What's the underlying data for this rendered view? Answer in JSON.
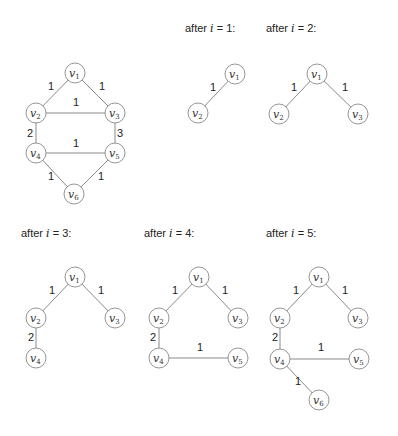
{
  "diagram": {
    "node_radius": 10,
    "panels": [
      {
        "id": "original",
        "caption": null,
        "nodes": [
          {
            "id": "v1",
            "label": "v",
            "sub": "1",
            "x": 75,
            "y": 73
          },
          {
            "id": "v2",
            "label": "v",
            "sub": "2",
            "x": 36,
            "y": 113
          },
          {
            "id": "v3",
            "label": "v",
            "sub": "3",
            "x": 115,
            "y": 113
          },
          {
            "id": "v4",
            "label": "v",
            "sub": "4",
            "x": 36,
            "y": 153
          },
          {
            "id": "v5",
            "label": "v",
            "sub": "5",
            "x": 115,
            "y": 153
          },
          {
            "id": "v6",
            "label": "v",
            "sub": "6",
            "x": 74,
            "y": 194
          }
        ],
        "edges": [
          {
            "from": "v1",
            "to": "v2",
            "weight": "1",
            "lx": 48,
            "ly": 90
          },
          {
            "from": "v1",
            "to": "v3",
            "weight": "1",
            "lx": 99,
            "ly": 90
          },
          {
            "from": "v2",
            "to": "v3",
            "weight": "1",
            "lx": 73,
            "ly": 106
          },
          {
            "from": "v2",
            "to": "v4",
            "weight": "2",
            "lx": 27,
            "ly": 137
          },
          {
            "from": "v3",
            "to": "v5",
            "weight": "3",
            "lx": 117,
            "ly": 137
          },
          {
            "from": "v4",
            "to": "v5",
            "weight": "1",
            "lx": 73,
            "ly": 147
          },
          {
            "from": "v4",
            "to": "v6",
            "weight": "1",
            "lx": 48,
            "ly": 180
          },
          {
            "from": "v5",
            "to": "v6",
            "weight": "1",
            "lx": 98,
            "ly": 180
          }
        ]
      },
      {
        "id": "after-1",
        "caption": {
          "prefix": "after ",
          "var": "i",
          "suffix": " = 1:",
          "x": 185,
          "y": 32
        },
        "nodes": [
          {
            "id": "v1",
            "label": "v",
            "sub": "1",
            "x": 235,
            "y": 74
          },
          {
            "id": "v2",
            "label": "v",
            "sub": "2",
            "x": 198,
            "y": 113
          }
        ],
        "edges": [
          {
            "from": "v1",
            "to": "v2",
            "weight": "1",
            "lx": 210,
            "ly": 91
          }
        ]
      },
      {
        "id": "after-2",
        "caption": {
          "prefix": "after ",
          "var": "i",
          "suffix": " = 2:",
          "x": 266,
          "y": 32
        },
        "nodes": [
          {
            "id": "v1",
            "label": "v",
            "sub": "1",
            "x": 317,
            "y": 74
          },
          {
            "id": "v2",
            "label": "v",
            "sub": "2",
            "x": 279,
            "y": 114
          },
          {
            "id": "v3",
            "label": "v",
            "sub": "3",
            "x": 358,
            "y": 114
          }
        ],
        "edges": [
          {
            "from": "v1",
            "to": "v2",
            "weight": "1",
            "lx": 291,
            "ly": 91
          },
          {
            "from": "v1",
            "to": "v3",
            "weight": "1",
            "lx": 342,
            "ly": 91
          }
        ]
      },
      {
        "id": "after-3",
        "caption": {
          "prefix": "after ",
          "var": "i",
          "suffix": " = 3:",
          "x": 21,
          "y": 237
        },
        "nodes": [
          {
            "id": "v1",
            "label": "v",
            "sub": "1",
            "x": 75,
            "y": 277
          },
          {
            "id": "v2",
            "label": "v",
            "sub": "2",
            "x": 36,
            "y": 318
          },
          {
            "id": "v3",
            "label": "v",
            "sub": "3",
            "x": 115,
            "y": 318
          },
          {
            "id": "v4",
            "label": "v",
            "sub": "4",
            "x": 36,
            "y": 358
          }
        ],
        "edges": [
          {
            "from": "v1",
            "to": "v2",
            "weight": "1",
            "lx": 49,
            "ly": 294
          },
          {
            "from": "v1",
            "to": "v3",
            "weight": "1",
            "lx": 98,
            "ly": 294
          },
          {
            "from": "v2",
            "to": "v4",
            "weight": "2",
            "lx": 28,
            "ly": 341
          }
        ]
      },
      {
        "id": "after-4",
        "caption": {
          "prefix": "after ",
          "var": "i",
          "suffix": " = 4:",
          "x": 144,
          "y": 237
        },
        "nodes": [
          {
            "id": "v1",
            "label": "v",
            "sub": "1",
            "x": 199,
            "y": 277
          },
          {
            "id": "v2",
            "label": "v",
            "sub": "2",
            "x": 159,
            "y": 318
          },
          {
            "id": "v3",
            "label": "v",
            "sub": "3",
            "x": 238,
            "y": 318
          },
          {
            "id": "v4",
            "label": "v",
            "sub": "4",
            "x": 159,
            "y": 358
          },
          {
            "id": "v5",
            "label": "v",
            "sub": "5",
            "x": 238,
            "y": 358
          }
        ],
        "edges": [
          {
            "from": "v1",
            "to": "v2",
            "weight": "1",
            "lx": 172,
            "ly": 294
          },
          {
            "from": "v1",
            "to": "v3",
            "weight": "1",
            "lx": 222,
            "ly": 294
          },
          {
            "from": "v2",
            "to": "v4",
            "weight": "2",
            "lx": 150,
            "ly": 341
          },
          {
            "from": "v4",
            "to": "v5",
            "weight": "1",
            "lx": 197,
            "ly": 351
          }
        ]
      },
      {
        "id": "after-5",
        "caption": {
          "prefix": "after ",
          "var": "i",
          "suffix": " = 5:",
          "x": 266,
          "y": 237
        },
        "nodes": [
          {
            "id": "v1",
            "label": "v",
            "sub": "1",
            "x": 319,
            "y": 277
          },
          {
            "id": "v2",
            "label": "v",
            "sub": "2",
            "x": 280,
            "y": 318
          },
          {
            "id": "v3",
            "label": "v",
            "sub": "3",
            "x": 358,
            "y": 318
          },
          {
            "id": "v4",
            "label": "v",
            "sub": "4",
            "x": 280,
            "y": 359
          },
          {
            "id": "v5",
            "label": "v",
            "sub": "5",
            "x": 359,
            "y": 359
          },
          {
            "id": "v6",
            "label": "v",
            "sub": "6",
            "x": 319,
            "y": 400
          }
        ],
        "edges": [
          {
            "from": "v1",
            "to": "v2",
            "weight": "1",
            "lx": 293,
            "ly": 294
          },
          {
            "from": "v1",
            "to": "v3",
            "weight": "1",
            "lx": 342,
            "ly": 294
          },
          {
            "from": "v2",
            "to": "v4",
            "weight": "2",
            "lx": 272,
            "ly": 341
          },
          {
            "from": "v4",
            "to": "v5",
            "weight": "1",
            "lx": 318,
            "ly": 351
          },
          {
            "from": "v4",
            "to": "v6",
            "weight": "1",
            "lx": 295,
            "ly": 385
          }
        ]
      }
    ]
  }
}
